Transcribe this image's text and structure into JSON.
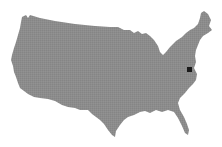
{
  "map": {
    "region": "Contiguous United States",
    "fill_color": "#8c8c8c",
    "background_color": "#ffffff",
    "marker": {
      "shape": "square",
      "color": "#1a1a1a",
      "x": 187,
      "y": 67,
      "size": 5
    }
  }
}
